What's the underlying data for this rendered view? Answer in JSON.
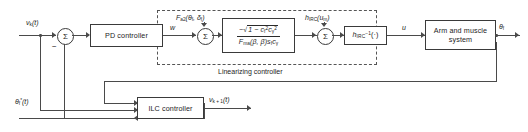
{
  "diagram": {
    "type": "control-block-diagram",
    "colors": {
      "line": "#4a4a4a",
      "border": "#3a3a3a",
      "text": "#1d1d1d",
      "background": "#ffffff",
      "dashed": "#555555"
    }
  },
  "blocks": {
    "pd_controller": "PD controller",
    "linearizing_gain_num_sign": "−",
    "linearizing_gain_num": "1 − c",
    "linearizing_gain_num_sub1": "f",
    "linearizing_gain_num_sup1": "2",
    "linearizing_gain_num_c2": "c",
    "linearizing_gain_num_sub2": "γ",
    "linearizing_gain_num_sup2": "2",
    "linearizing_gain_den": "F",
    "linearizing_gain_den_sub": "ma",
    "linearizing_gain_den_args": "(β, β̇)s",
    "linearizing_gain_den_sub2": "f",
    "linearizing_gain_den_c": "c",
    "linearizing_gain_den_sub3": "γ",
    "irc_inverse": "h",
    "irc_inverse_sub": "IRC",
    "irc_inverse_sup": "−1",
    "irc_inverse_arg": "(·)",
    "arm_muscle_line1": "Arm and muscle",
    "arm_muscle_line2": "system",
    "ilc_controller": "ILC controller"
  },
  "group_labels": {
    "linearizing_controller": "Linearizing controller"
  },
  "signals": {
    "input_vk": "v",
    "input_vk_sub": "k",
    "input_vk_arg": "(t)",
    "w": "w",
    "u": "u",
    "theta_f": "θ",
    "theta_f_sub": "f",
    "theta_ref": "θ",
    "theta_ref_sub": "f",
    "theta_ref_sup": "*",
    "theta_ref_arg": "(t)",
    "v_next": "v",
    "v_next_sub": "k + 1",
    "v_next_arg": "(t)",
    "fa2": "F",
    "fa2_sub": "a2",
    "fa2_args": "(θ",
    "fa2_args_sub1": "f",
    "fa2_args_mid": ", δ",
    "fa2_args_sub2": "f",
    "fa2_args_end": ")",
    "h_irc_um": "h",
    "h_irc_um_sub": "IRC",
    "h_irc_um_arg": "(u",
    "h_irc_um_arg_sub": "m",
    "h_irc_um_arg_end": ")"
  },
  "summing_junctions": {
    "sum1_symbol": "Σ",
    "sum1_sign": "−",
    "sum2_symbol": "Σ",
    "sum3_symbol": "Σ"
  }
}
